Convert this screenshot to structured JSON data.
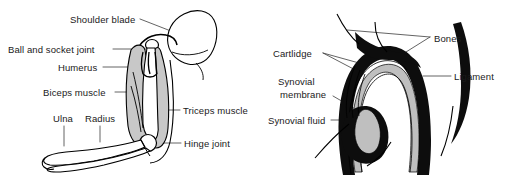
{
  "figures": [
    {
      "id": "arm-shoulder-elbow",
      "name": "arm-shoulder-elbow-diagram",
      "labels": [
        {
          "key": "shoulder_blade",
          "text": "Shoulder blade",
          "side": "left"
        },
        {
          "key": "ball_and_socket",
          "text": "Ball and socket joint",
          "side": "left"
        },
        {
          "key": "humerus",
          "text": "Humerus",
          "side": "left"
        },
        {
          "key": "biceps_muscle",
          "text": "Biceps muscle",
          "side": "left"
        },
        {
          "key": "ulna",
          "text": "Ulna",
          "side": "left"
        },
        {
          "key": "radius",
          "text": "Radius",
          "side": "left"
        },
        {
          "key": "triceps_muscle",
          "text": "Triceps muscle",
          "side": "right"
        },
        {
          "key": "hinge_joint",
          "text": "Hinge joint",
          "side": "right"
        }
      ]
    },
    {
      "id": "synovial-joint-cross-section",
      "name": "synovial-joint-cross-section-diagram",
      "labels": [
        {
          "key": "cartlidge",
          "text": "Cartlidge",
          "side": "left"
        },
        {
          "key": "synovial_membrane_1",
          "text": "Synovial",
          "side": "left"
        },
        {
          "key": "synovial_membrane_2",
          "text": "membrane",
          "side": "left"
        },
        {
          "key": "synovial_fluid",
          "text": "Synovial fluid",
          "side": "left"
        },
        {
          "key": "bones",
          "text": "Bones",
          "side": "right"
        },
        {
          "key": "ligament",
          "text": "Ligament",
          "side": "right"
        }
      ]
    }
  ],
  "arm": {
    "shoulder_blade": "Shoulder blade",
    "ball_and_socket_joint": "Ball and socket joint",
    "humerus": "Humerus",
    "biceps_muscle": "Biceps muscle",
    "ulna": "Ulna",
    "radius": "Radius",
    "triceps_muscle": "Triceps muscle",
    "hinge_joint": "Hinge joint"
  },
  "joint": {
    "cartlidge": "Cartlidge",
    "synovial_membrane_line1": "Synovial",
    "synovial_membrane_line2": "membrane",
    "synovial_fluid": "Synovial fluid",
    "bones": "Bones",
    "ligament": "Ligament"
  },
  "colors": {
    "background": "#ffffff",
    "ink": "#1a1a1a",
    "outline": "#000000",
    "muscle_fill": "#c8c8c8",
    "bone_fill": "#ffffff",
    "cartilage_fill": "#bfbfbf",
    "dense_fill": "#0d0d0d",
    "leader_line": "#3c3c3c"
  }
}
